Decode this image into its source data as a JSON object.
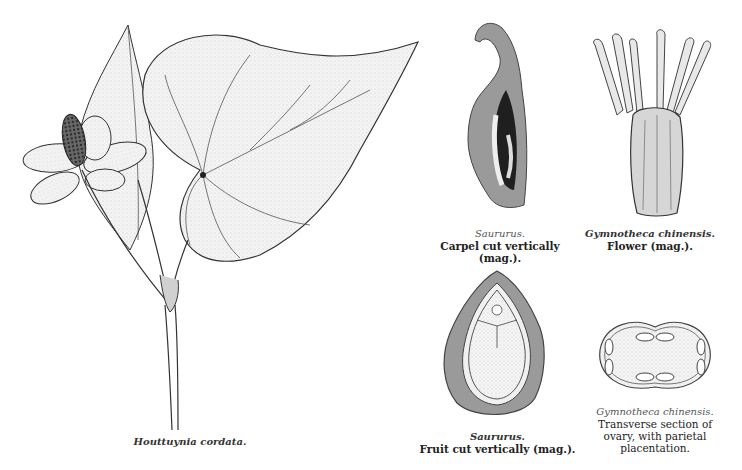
{
  "plate": {
    "figures": [
      {
        "id": "houttuynia",
        "species": "Houttuynia cordata.",
        "description": ""
      },
      {
        "id": "saururus-carpel",
        "species": "Saururus.",
        "description": "Carpel cut vertically (mag.)."
      },
      {
        "id": "gymnotheca-flower",
        "species": "Gymnotheca chinensis.",
        "description": "Flower (mag.)."
      },
      {
        "id": "saururus-fruit",
        "species": "Saururus.",
        "description": "Fruit cut vertically (mag.)."
      },
      {
        "id": "gymnotheca-ovary",
        "species": "Gymnotheca chinensis.",
        "description_lines": [
          "Transverse section of",
          "ovary, with parietal",
          "placentation."
        ]
      }
    ]
  },
  "colors": {
    "ink": "#1a1a1a",
    "shade": "#8a8a8a",
    "paper": "#ffffff"
  }
}
